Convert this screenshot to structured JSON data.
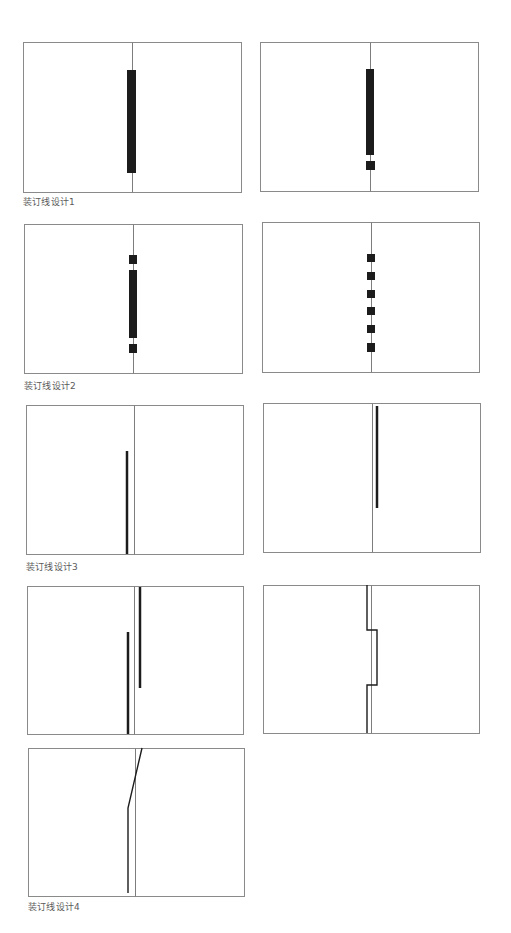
{
  "colors": {
    "background": "#ffffff",
    "page_border": "#8a8a8a",
    "spine_line": "#7d7d7d",
    "binding_mark": "#1c1c1c",
    "caption_text": "#5a5a5a"
  },
  "captions": [
    {
      "text": "装订线设计1",
      "x": 23,
      "y": 197
    },
    {
      "text": "装订线设计2",
      "x": 24,
      "y": 381
    },
    {
      "text": "装订线设计3",
      "x": 26,
      "y": 562
    },
    {
      "text": "装订线设计4",
      "x": 28,
      "y": 902
    }
  ],
  "panels": [
    {
      "name": "design-1a",
      "x": 23,
      "y": 42,
      "w": 218,
      "h": 150,
      "spine_x": 132,
      "marks": [
        {
          "type": "rect",
          "x": 127,
          "y": 70,
          "w": 9,
          "h": 103
        }
      ]
    },
    {
      "name": "design-1b",
      "x": 260,
      "y": 42,
      "w": 218,
      "h": 149,
      "spine_x": 370,
      "marks": [
        {
          "type": "rect",
          "x": 366,
          "y": 69,
          "w": 8,
          "h": 86
        },
        {
          "type": "rect",
          "x": 366,
          "y": 161,
          "w": 9,
          "h": 9
        }
      ]
    },
    {
      "name": "design-2a",
      "x": 24,
      "y": 224,
      "w": 218,
      "h": 149,
      "spine_x": 133,
      "marks": [
        {
          "type": "rect",
          "x": 129,
          "y": 255,
          "w": 8,
          "h": 9
        },
        {
          "type": "rect",
          "x": 129,
          "y": 270,
          "w": 8,
          "h": 68
        },
        {
          "type": "rect",
          "x": 129,
          "y": 344,
          "w": 8,
          "h": 9
        }
      ]
    },
    {
      "name": "design-2b",
      "x": 262,
      "y": 222,
      "w": 217,
      "h": 150,
      "spine_x": 371,
      "marks": [
        {
          "type": "rect",
          "x": 367,
          "y": 254,
          "w": 8,
          "h": 8
        },
        {
          "type": "rect",
          "x": 367,
          "y": 272,
          "w": 8,
          "h": 8
        },
        {
          "type": "rect",
          "x": 367,
          "y": 290,
          "w": 8,
          "h": 8
        },
        {
          "type": "rect",
          "x": 367,
          "y": 307,
          "w": 8,
          "h": 8
        },
        {
          "type": "rect",
          "x": 367,
          "y": 325,
          "w": 8,
          "h": 8
        },
        {
          "type": "rect",
          "x": 367,
          "y": 343,
          "w": 8,
          "h": 9
        }
      ]
    },
    {
      "name": "design-3a",
      "x": 26,
      "y": 405,
      "w": 217,
      "h": 149,
      "spine_x": 134,
      "marks": [
        {
          "type": "polyline",
          "points": "127,451 127,554",
          "stroke_width": 2.5
        }
      ]
    },
    {
      "name": "design-3b",
      "x": 263,
      "y": 403,
      "w": 217,
      "h": 149,
      "spine_x": 372,
      "marks": [
        {
          "type": "polyline",
          "points": "377,406 377,508",
          "stroke_width": 2.5
        }
      ]
    },
    {
      "name": "design-4a",
      "x": 27,
      "y": 586,
      "w": 216,
      "h": 148,
      "spine_x": 134,
      "marks": [
        {
          "type": "polyline",
          "points": "140,587 140,688",
          "stroke_width": 2.5
        },
        {
          "type": "polyline",
          "points": "128,632 128,734",
          "stroke_width": 2.5
        }
      ]
    },
    {
      "name": "design-4b",
      "x": 263,
      "y": 585,
      "w": 216,
      "h": 148,
      "spine_x": 371,
      "marks": [
        {
          "type": "polyline",
          "points": "367,585 367,630 377,630 377,685 367,685 367,733",
          "stroke_width": 1.4
        }
      ]
    },
    {
      "name": "design-4c",
      "x": 28,
      "y": 748,
      "w": 216,
      "h": 148,
      "spine_x": 135,
      "marks": [
        {
          "type": "polyline",
          "points": "142,748 128,808 128,893",
          "stroke_width": 1.4
        }
      ]
    }
  ]
}
